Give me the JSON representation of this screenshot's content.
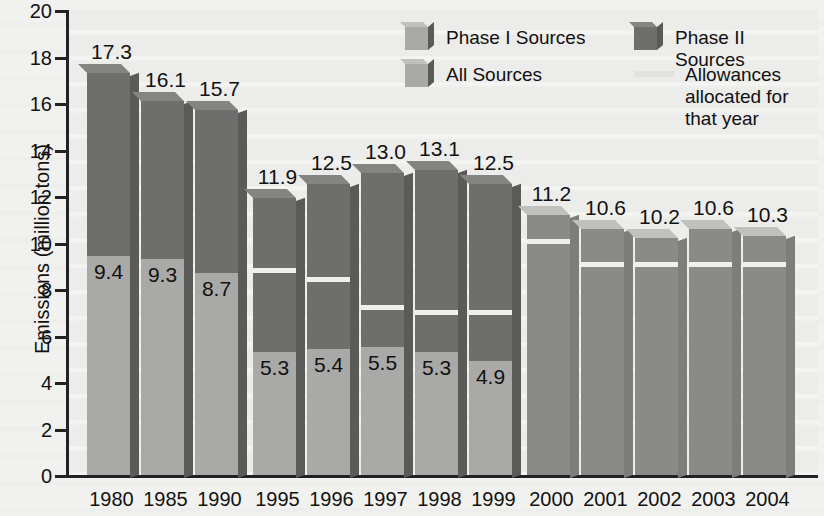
{
  "chart_data": {
    "type": "bar",
    "title": "",
    "xlabel": "",
    "ylabel": "Emissions (million tons)",
    "ylim": [
      0,
      20
    ],
    "yticks": [
      0,
      2,
      4,
      6,
      8,
      10,
      12,
      14,
      16,
      18,
      20
    ],
    "grid": false,
    "legend_position": "top-right",
    "categories": [
      "1980",
      "1985",
      "1990",
      "1995",
      "1996",
      "1997",
      "1998",
      "1999",
      "2000",
      "2001",
      "2002",
      "2003",
      "2004"
    ],
    "series": [
      {
        "name": "Phase I Sources",
        "values": [
          9.4,
          9.3,
          8.7,
          5.3,
          5.4,
          5.5,
          5.3,
          4.9,
          null,
          null,
          null,
          null,
          null
        ]
      },
      {
        "name": "Phase II Sources",
        "values": [
          7.9,
          6.8,
          7.0,
          6.6,
          7.1,
          7.5,
          7.8,
          7.6,
          null,
          null,
          null,
          null,
          null
        ]
      },
      {
        "name": "All Sources",
        "values": [
          null,
          null,
          null,
          null,
          null,
          null,
          null,
          null,
          11.2,
          10.6,
          10.2,
          10.6,
          10.3
        ]
      },
      {
        "name": "Allowances allocated for that year",
        "values": [
          null,
          null,
          null,
          8.7,
          8.3,
          7.1,
          6.9,
          6.9,
          9.95,
          8.95,
          8.95,
          8.95,
          8.95
        ]
      }
    ],
    "totals": [
      17.3,
      16.1,
      15.7,
      11.9,
      12.5,
      13.0,
      13.1,
      12.5,
      11.2,
      10.6,
      10.2,
      10.6,
      10.3
    ],
    "total_labels": [
      "17.3",
      "16.1",
      "15.7",
      "11.9",
      "12.5",
      "13.0",
      "13.1",
      "12.5",
      "11.2",
      "10.6",
      "10.2",
      "10.6",
      "10.3"
    ],
    "phase1_labels": [
      "9.4",
      "9.3",
      "8.7",
      "5.3",
      "5.4",
      "5.5",
      "5.3",
      "4.9",
      "",
      "",
      "",
      "",
      ""
    ],
    "legend": [
      {
        "label": "Phase I Sources",
        "type": "swatch",
        "color": "#a9a9a7"
      },
      {
        "label": "Phase II Sources",
        "type": "swatch",
        "color": "#6e6e6c"
      },
      {
        "label": "All Sources",
        "type": "swatch",
        "color": "#a9a9a7"
      },
      {
        "label": "Allowances allocated for that year",
        "type": "line",
        "color": "#e2e2e0"
      }
    ],
    "colors": {
      "phase1": "#a9a9a7",
      "phase2": "#6e6e6c",
      "all": "#8a8a88",
      "allowance_line": "#efefed",
      "background": "#f1f1ef",
      "axis": "#222222"
    }
  }
}
